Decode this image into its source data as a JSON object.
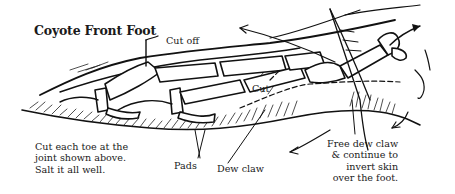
{
  "diagram": {
    "title": "Coyote Front Foot",
    "labels": {
      "cut_off": "Cut off",
      "cut": "Cut",
      "pads": "Pads",
      "dew_claw": "Dew claw"
    },
    "notes": {
      "left": [
        "Cut each toe at the",
        "joint shown above.",
        "Salt it all well."
      ],
      "right": [
        "Free dew claw",
        "& continue to",
        "invert skin",
        "over the foot."
      ]
    },
    "colors": {
      "ink": "#111111",
      "background": "#ffffff"
    }
  }
}
